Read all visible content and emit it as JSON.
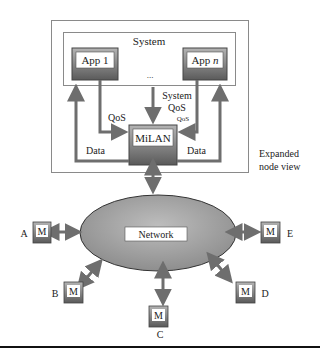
{
  "diagram": {
    "outer_box_label": [
      "Expanded",
      "node view"
    ],
    "system_label": "System",
    "apps": [
      {
        "name": "App 1",
        "prefix": "App 1",
        "suffix": ""
      },
      {
        "name": "App n",
        "prefix": "App ",
        "suffix": "n"
      }
    ],
    "ellipsis": "...",
    "middleware_label": "MiLAN",
    "edge_labels": {
      "qos_left": "QoS",
      "system_qos_line1": "System",
      "system_qos_line2": "QoS",
      "qos_right": "QoS",
      "data_left": "Data",
      "data_right": "Data"
    },
    "network_label": "Network",
    "node_glyph": "M",
    "nodes": [
      {
        "id": "A",
        "label": "A"
      },
      {
        "id": "B",
        "label": "B"
      },
      {
        "id": "C",
        "label": "C"
      },
      {
        "id": "D",
        "label": "D"
      },
      {
        "id": "E",
        "label": "E"
      }
    ],
    "colors": {
      "arrow": "#6e6e6e",
      "box_border": "#555555",
      "box_fill_top": "#a8a8a8",
      "box_fill_bottom": "#5e5e5e",
      "ellipse_fill": "#a9a9a9",
      "frame": "#888888"
    }
  }
}
